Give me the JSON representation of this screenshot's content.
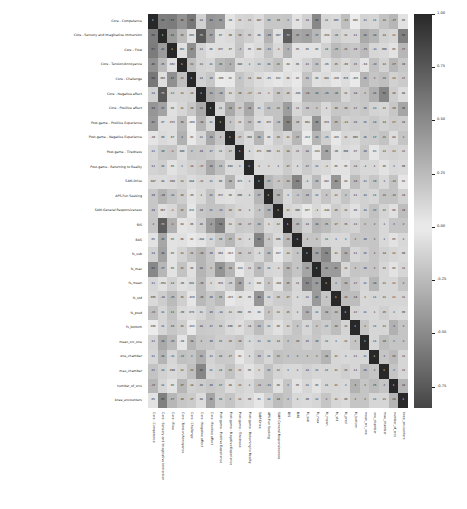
{
  "chart_data": {
    "type": "heatmap",
    "title": "",
    "xlabel": "",
    "ylabel": "",
    "grid": false,
    "colormap": "gray-diverging",
    "colorbar": {
      "position": "right",
      "vmin": -0.85,
      "vmax": 1.0,
      "ticks": [
        1.0,
        0.75,
        0.5,
        0.25,
        0.0,
        -0.25,
        -0.5,
        -0.75
      ],
      "tick_labels": [
        "1.00",
        "0.75",
        "0.50",
        "0.25",
        "0.00",
        "-0.25",
        "-0.50",
        "-0.75"
      ]
    },
    "annotated": true,
    "categories": [
      "Core - Competence",
      "Core - Sensory and Imaginative Immersion",
      "Core - Flow",
      "Core - Tension/Annoyance",
      "Core - Challenge",
      "Core - Negative affect",
      "Core - Positive affect",
      "Post-game - Positive Experience",
      "Post-game - Negative Experience",
      "Post-game - Tiredness",
      "Post-game - Returning to Reality",
      "SAM-Drive",
      "APS-Fun Seeking",
      "SAM-General Responsiveness",
      "BIS",
      "BAS",
      "fs_sub",
      "fs_max",
      "fs_mean",
      "fs_std",
      "fs_pred",
      "fs_bottom",
      "mean_src_one",
      "one_chamber",
      "max_chamber",
      "number_of_srcs",
      "knee_encounters"
    ],
    "x": [
      "Core - Competence",
      "Core - Sensory and Imaginative Immersion",
      "Core - Flow",
      "Core - Tension/Annoyance",
      "Core - Challenge",
      "Core - Negative affect",
      "Core - Positive affect",
      "Post-game - Positive Experience",
      "Post-game - Negative Experience",
      "Post-game - Tiredness",
      "Post-game - Returning to Reality",
      "SAM-Drive",
      "APS-Fun Seeking",
      "SAM-General Responsiveness",
      "BIS",
      "BAS",
      "fs_sub",
      "fs_max",
      "fs_mean",
      "fs_std",
      "fs_pred",
      "fs_bottom",
      "mean_src_one",
      "one_chamber",
      "max_chamber",
      "number_of_srcs",
      "knee_encounters"
    ],
    "y": [
      "Core - Competence",
      "Core - Sensory and Imaginative Immersion",
      "Core - Flow",
      "Core - Tension/Annoyance",
      "Core - Challenge",
      "Core - Negative affect",
      "Core - Positive affect",
      "Post-game - Positive Experience",
      "Post-game - Negative Experience",
      "Post-game - Tiredness",
      "Post-game - Returning to Reality",
      "SAM-Drive",
      "APS-Fun Seeking",
      "SAM-General Responsiveness",
      "BIS",
      "BAS",
      "fs_sub",
      "fs_max",
      "fs_mean",
      "fs_std",
      "fs_pred",
      "fs_bottom",
      "mean_src_one",
      "one_chamber",
      "max_chamber",
      "number_of_srcs",
      "knee_encounters"
    ],
    "values": [
      [
        1,
        0.56,
        0.57,
        0.46,
        0.59,
        0.14,
        0.44,
        0.42,
        -0.04,
        0.11,
        0.13,
        0.087,
        0.19,
        0.19,
        0.2,
        0.05,
        0.14,
        0.51,
        0.11,
        0.095,
        -0.23,
        0.006,
        0.13,
        0.11,
        0.21,
        -0.27,
        0.05
      ],
      [
        0.56,
        1,
        0.41,
        0.25,
        0.065,
        0.75,
        0.37,
        0.07,
        0.09,
        0.19,
        0.15,
        0.08,
        -0.29,
        0.067,
        0.73,
        0.35,
        0.38,
        0.27,
        -0.054,
        -0.16,
        0.11,
        0.11,
        0.34,
        0.28,
        0.14,
        0.11,
        0.55
      ],
      [
        0.57,
        0.41,
        1,
        0.062,
        0.47,
        0.13,
        0.06,
        0.072,
        0.07,
        -0.2,
        0.05,
        0.094,
        -0.21,
        -0.1,
        0.3,
        0.05,
        0.05,
        0.05,
        0.14,
        -0.25,
        0.21,
        0.19,
        -0.25,
        -0.11,
        0.099,
        0.05,
        0.27
      ],
      [
        0.46,
        0.25,
        0.062,
        1,
        0.23,
        0.13,
        0.11,
        0.26,
        0.3,
        0.089,
        0.1,
        0.13,
        0.16,
        0.22,
        0.04,
        0.06,
        0.13,
        0.21,
        -0.06,
        0.15,
        -0.09,
        0.15,
        -0.04,
        -0.22,
        0.13,
        0.27,
        0.19
      ],
      [
        0.59,
        0.065,
        0.47,
        0.23,
        1,
        0.14,
        0.19,
        -0.009,
        0.02,
        0.2,
        0.14,
        0.084,
        -0.05,
        0.032,
        0.06,
        0.02,
        0.21,
        0.06,
        0.081,
        -0.029,
        0.074,
        -0.015,
        0.28,
        0.2,
        0.23,
        0.14,
        0.17
      ],
      [
        0.14,
        0.75,
        0.13,
        0.13,
        0.14,
        1,
        0.33,
        -0.28,
        0.11,
        0.19,
        -0.17,
        -0.11,
        0.1,
        0.19,
        0.16,
        -0.044,
        -0.28,
        0.28,
        -0.26,
        -0.26,
        0.11,
        0.18,
        0.2,
        0.31,
        0.52,
        0.16,
        0.08
      ],
      [
        0.44,
        0.37,
        0.06,
        0.11,
        0.19,
        0.33,
        1,
        0.11,
        0.34,
        0.17,
        0.34,
        0.11,
        0.215,
        0.21,
        0.4,
        0.11,
        0.19,
        0.2,
        0.1,
        0.19,
        0.19,
        0.17,
        0.19,
        0.13,
        0.11,
        0.19,
        0.36
      ],
      [
        0.42,
        0.07,
        0.072,
        0.26,
        -0.009,
        -0.28,
        0.11,
        1,
        0.2,
        0.11,
        0.232,
        0.09,
        0.072,
        -0.21,
        0.54,
        0.19,
        0.064,
        0.45,
        0.074,
        0.25,
        -0.14,
        0.16,
        0.15,
        0.18,
        0.14,
        0.17,
        0.16
      ],
      [
        -0.04,
        0.09,
        0.07,
        0.3,
        0.02,
        0.11,
        0.34,
        0.2,
        1,
        0.17,
        0.094,
        0.28,
        0.06,
        0.16,
        0.11,
        0.27,
        -0.012,
        0.28,
        -0.15,
        -0.025,
        0.11,
        0.096,
        0.16,
        0.17,
        0.21,
        0.08,
        0.2
      ],
      [
        0.11,
        0.19,
        -0.2,
        0.089,
        0.2,
        0.19,
        0.17,
        0.11,
        0.17,
        1,
        0.1,
        0.073,
        0.096,
        0.11,
        0.18,
        0.12,
        0.18,
        -0.024,
        0.36,
        -0.06,
        0.094,
        0.07,
        0.19,
        0.03,
        0.11,
        0.13,
        0.11
      ],
      [
        0.13,
        0.15,
        0.05,
        0.1,
        0.14,
        -0.17,
        0.34,
        0.232,
        0.094,
        0.1,
        1,
        0.1,
        0.1,
        0.1,
        0.17,
        0.1,
        0.17,
        0.11,
        -0.1,
        0.05,
        0.05,
        0.14,
        -0.1,
        0.1,
        0.05,
        0.1,
        0.09
      ],
      [
        0.087,
        0.08,
        0.094,
        0.13,
        0.084,
        -0.11,
        0.11,
        0.09,
        0.28,
        0.073,
        0.1,
        1,
        0.27,
        -0.2,
        0.24,
        0.53,
        -0.1,
        0.25,
        0.042,
        0.44,
        0.04,
        0.24,
        0.13,
        0.19,
        0.1,
        -0.21,
        0.03
      ],
      [
        0.19,
        -0.29,
        -0.21,
        0.16,
        -0.05,
        0.1,
        0.215,
        0.072,
        0.06,
        0.096,
        0.1,
        0.27,
        1,
        0.29,
        0.1,
        -0.2,
        0.24,
        0.11,
        0.2,
        0.11,
        0.2,
        0.11,
        0.14,
        0.11,
        0.21,
        -0.21,
        0.14
      ],
      [
        0.19,
        0.067,
        -0.1,
        0.22,
        0.032,
        0.19,
        0.21,
        -0.21,
        0.16,
        0.11,
        0.1,
        -0.2,
        0.29,
        1,
        0.12,
        0.096,
        0.027,
        -0.1,
        -0.044,
        0.16,
        0.11,
        0.06,
        0.14,
        0.22,
        0.12,
        0.06,
        0.24
      ],
      [
        0.2,
        0.73,
        0.3,
        0.04,
        0.06,
        0.16,
        0.4,
        0.54,
        0.11,
        0.18,
        0.17,
        0.24,
        0.1,
        0.12,
        1,
        0.26,
        0.14,
        0.28,
        0.25,
        0.17,
        0.15,
        0.13,
        0.2,
        0.2,
        0.1,
        0.2,
        0.2
      ],
      [
        0.05,
        0.35,
        0.05,
        0.06,
        0.02,
        -0.044,
        0.11,
        0.19,
        0.27,
        0.12,
        0.1,
        0.53,
        -0.2,
        0.096,
        0.26,
        1,
        0.2,
        0.2,
        0.11,
        0.1,
        0.1,
        0.2,
        0.19,
        0.2,
        0.1,
        0.05,
        0.1
      ],
      [
        0.14,
        0.38,
        0.05,
        0.13,
        0.21,
        -0.28,
        0.19,
        0.064,
        -0.012,
        0.18,
        0.17,
        -0.1,
        0.24,
        0.027,
        0.14,
        0.2,
        1,
        0.36,
        0.51,
        0.11,
        0.31,
        0.11,
        0.15,
        0.2,
        0.14,
        0.11,
        0.09
      ],
      [
        0.51,
        0.27,
        0.05,
        0.21,
        0.06,
        0.28,
        0.2,
        0.45,
        0.28,
        -0.024,
        0.11,
        0.25,
        0.11,
        -0.1,
        0.28,
        0.2,
        0.36,
        1,
        0.41,
        0.42,
        0.11,
        0.2,
        0.19,
        0.2,
        0.11,
        0.05,
        0.11
      ],
      [
        0.11,
        -0.054,
        0.14,
        -0.06,
        0.081,
        -0.26,
        0.1,
        0.074,
        -0.15,
        0.36,
        -0.1,
        0.042,
        0.2,
        -0.044,
        0.25,
        0.11,
        0.51,
        0.41,
        1,
        0.2,
        0.278,
        0.17,
        0.11,
        0.28,
        0.11,
        0.11,
        0.2
      ],
      [
        0.095,
        -0.16,
        -0.25,
        0.15,
        -0.029,
        -0.26,
        0.19,
        0.25,
        -0.025,
        -0.06,
        0.05,
        0.44,
        0.11,
        0.16,
        0.17,
        0.1,
        0.11,
        0.42,
        0.2,
        1,
        0.24,
        0.24,
        0.1,
        0.11,
        0.11,
        0.11,
        0.11
      ],
      [
        -0.23,
        0.11,
        0.21,
        -0.09,
        0.074,
        0.11,
        0.19,
        -0.14,
        0.11,
        0.094,
        0.05,
        0.04,
        0.2,
        0.11,
        0.15,
        0.1,
        0.31,
        0.11,
        0.278,
        0.24,
        1,
        0.12,
        0.11,
        0.1,
        0.15,
        0.1,
        0.09
      ],
      [
        0.006,
        0.11,
        0.19,
        0.15,
        -0.015,
        0.18,
        0.17,
        0.16,
        0.096,
        0.07,
        0.14,
        0.24,
        0.11,
        0.06,
        0.13,
        0.2,
        0.11,
        0.2,
        0.17,
        0.24,
        0.12,
        1,
        0.2,
        0.11,
        0.11,
        0.3,
        0.2
      ],
      [
        0.13,
        0.34,
        -0.25,
        -0.04,
        0.28,
        0.2,
        0.19,
        0.15,
        0.16,
        0.19,
        -0.1,
        0.13,
        0.14,
        0.14,
        0.2,
        0.19,
        0.15,
        0.19,
        0.11,
        0.1,
        0.11,
        0.2,
        1,
        0.11,
        0.24,
        0.2,
        0.2
      ],
      [
        0.11,
        0.28,
        -0.11,
        -0.22,
        0.2,
        0.31,
        0.13,
        0.18,
        0.17,
        0.03,
        0.1,
        0.19,
        0.11,
        0.22,
        0.2,
        0.2,
        0.2,
        0.2,
        0.28,
        0.11,
        0.1,
        0.11,
        0.11,
        1,
        0.2,
        0.25,
        0.11
      ],
      [
        0.21,
        0.14,
        0.099,
        0.13,
        0.23,
        0.52,
        0.11,
        0.14,
        0.21,
        0.11,
        0.05,
        0.1,
        0.21,
        0.12,
        0.1,
        0.1,
        0.14,
        0.11,
        0.11,
        0.11,
        0.15,
        0.11,
        0.24,
        0.2,
        1,
        0.2,
        0.11
      ],
      [
        -0.27,
        0.11,
        0.05,
        0.27,
        0.14,
        0.16,
        0.19,
        0.17,
        0.08,
        0.13,
        0.1,
        -0.21,
        -0.21,
        0.06,
        0.2,
        0.05,
        0.11,
        0.05,
        0.11,
        0.11,
        0.1,
        0.3,
        0.2,
        0.25,
        0.2,
        1,
        0.28
      ],
      [
        0.05,
        0.55,
        0.27,
        0.19,
        0.17,
        0.08,
        0.36,
        0.16,
        0.2,
        0.11,
        0.09,
        0.03,
        0.14,
        0.24,
        0.2,
        0.1,
        0.09,
        0.11,
        0.2,
        0.11,
        0.09,
        0.2,
        0.2,
        0.11,
        0.11,
        0.28,
        1
      ]
    ]
  }
}
